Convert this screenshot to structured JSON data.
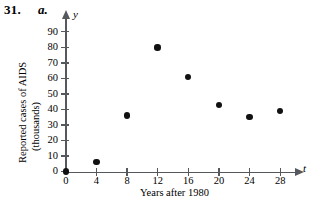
{
  "exercise": {
    "number": "31.",
    "part": "a."
  },
  "chart_data": {
    "type": "scatter",
    "title": "",
    "xlabel": "Years after 1980",
    "ylabel_line1": "Reported cases of AIDS",
    "ylabel_line2": "(thousands)",
    "x_var": "t",
    "y_var": "y",
    "x": [
      0,
      4,
      8,
      12,
      16,
      20,
      24,
      28
    ],
    "values": [
      0,
      6,
      36,
      80,
      61,
      43,
      35,
      39
    ],
    "xticks": [
      "0",
      "4",
      "8",
      "12",
      "16",
      "20",
      "24",
      "28"
    ],
    "yticks": [
      "0",
      "10",
      "20",
      "30",
      "40",
      "50",
      "60",
      "70",
      "80",
      "90"
    ],
    "xlim": [
      0,
      30
    ],
    "ylim": [
      0,
      95
    ],
    "grid": false,
    "legend": "none",
    "marker_color": "#111111",
    "axis_color": "#55585c"
  }
}
